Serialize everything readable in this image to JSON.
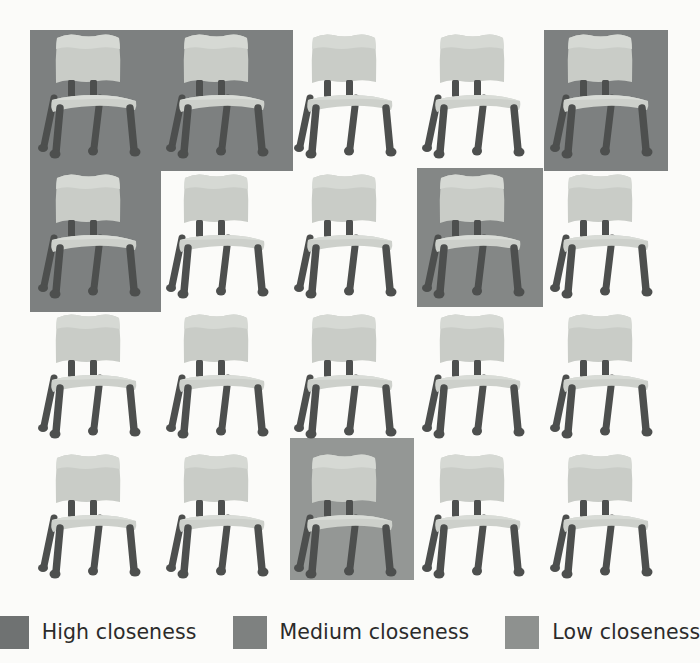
{
  "figure": {
    "background_color": "#fbfbf9",
    "grid": {
      "rows": 4,
      "columns": 5,
      "cell_width": 126,
      "cell_height": 142,
      "origin_x": 30,
      "origin_y": 28,
      "col_step": 128,
      "row_step": 140,
      "item_name": "chair",
      "total_items": 20
    }
  },
  "chair": {
    "seat_color": "#cdd0cb",
    "seat_shadow_color": "#b4b8b3",
    "back_color": "#c9ccc7",
    "leg_color": "#4d4f4e",
    "leg_highlight_color": "#636664"
  },
  "highlights": [
    {
      "id": "h1",
      "level": "high",
      "color": "#7d8080",
      "x": 30,
      "y": 30,
      "width": 263,
      "height": 141,
      "covers": "row1-col1,row1-col2"
    },
    {
      "id": "h2",
      "level": "high",
      "color": "#7d8080",
      "x": 544,
      "y": 30,
      "width": 124,
      "height": 141,
      "covers": "row1-col5"
    },
    {
      "id": "h3",
      "level": "high",
      "color": "#7d8080",
      "x": 30,
      "y": 171,
      "width": 131,
      "height": 141,
      "covers": "row2-col1"
    },
    {
      "id": "h4",
      "level": "medium",
      "color": "#848786",
      "x": 417,
      "y": 168,
      "width": 126,
      "height": 139,
      "covers": "row2-col4"
    },
    {
      "id": "h5",
      "level": "low",
      "color": "#949795",
      "x": 290,
      "y": 438,
      "width": 124,
      "height": 142,
      "covers": "row4-col3"
    }
  ],
  "chairs": [
    {
      "row": 1,
      "col": 1,
      "highlight": "high"
    },
    {
      "row": 1,
      "col": 2,
      "highlight": "high"
    },
    {
      "row": 1,
      "col": 3,
      "highlight": "none"
    },
    {
      "row": 1,
      "col": 4,
      "highlight": "none"
    },
    {
      "row": 1,
      "col": 5,
      "highlight": "high"
    },
    {
      "row": 2,
      "col": 1,
      "highlight": "high"
    },
    {
      "row": 2,
      "col": 2,
      "highlight": "none"
    },
    {
      "row": 2,
      "col": 3,
      "highlight": "none"
    },
    {
      "row": 2,
      "col": 4,
      "highlight": "medium"
    },
    {
      "row": 2,
      "col": 5,
      "highlight": "none"
    },
    {
      "row": 3,
      "col": 1,
      "highlight": "none"
    },
    {
      "row": 3,
      "col": 2,
      "highlight": "none"
    },
    {
      "row": 3,
      "col": 3,
      "highlight": "none"
    },
    {
      "row": 3,
      "col": 4,
      "highlight": "none"
    },
    {
      "row": 3,
      "col": 5,
      "highlight": "none"
    },
    {
      "row": 4,
      "col": 1,
      "highlight": "none"
    },
    {
      "row": 4,
      "col": 2,
      "highlight": "none"
    },
    {
      "row": 4,
      "col": 3,
      "highlight": "low"
    },
    {
      "row": 4,
      "col": 4,
      "highlight": "none"
    },
    {
      "row": 4,
      "col": 5,
      "highlight": "none"
    }
  ],
  "legend": {
    "items": [
      {
        "label": "High closeness",
        "color": "#6f7272",
        "level": "high"
      },
      {
        "label": "Medium closeness",
        "color": "#7e8180",
        "level": "medium"
      },
      {
        "label": "Low closeness",
        "color": "#8e918f",
        "level": "low"
      }
    ]
  }
}
